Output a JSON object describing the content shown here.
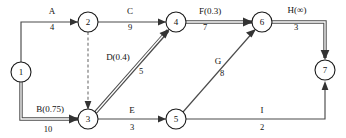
{
  "diagram": {
    "type": "activity-on-arrow-network",
    "nodes": [
      {
        "id": "1",
        "label": "1",
        "cx": 21,
        "cy": 72
      },
      {
        "id": "2",
        "label": "2",
        "cx": 88,
        "cy": 22
      },
      {
        "id": "3",
        "label": "3",
        "cx": 88,
        "cy": 119
      },
      {
        "id": "4",
        "label": "4",
        "cx": 176,
        "cy": 22
      },
      {
        "id": "5",
        "label": "5",
        "cx": 176,
        "cy": 119
      },
      {
        "id": "6",
        "label": "6",
        "cx": 262,
        "cy": 22
      },
      {
        "id": "7",
        "label": "7",
        "cx": 325,
        "cy": 70
      }
    ],
    "edges": [
      {
        "id": "A",
        "name": "A",
        "duration": "4",
        "from": "1",
        "to": "2",
        "style": "thin",
        "name_x": 52,
        "name_y": 14,
        "dur_x": 52,
        "dur_y": 30
      },
      {
        "id": "B",
        "name": "B(0.75)",
        "duration": "10",
        "from": "1",
        "to": "3",
        "style": "critical",
        "name_x": 50,
        "name_y": 112,
        "dur_x": 48,
        "dur_y": 132
      },
      {
        "id": "C",
        "name": "C",
        "duration": "9",
        "from": "2",
        "to": "4",
        "style": "thin",
        "name_x": 130,
        "name_y": 14,
        "dur_x": 130,
        "dur_y": 30
      },
      {
        "id": "dummy",
        "name": "",
        "duration": "",
        "from": "2",
        "to": "3",
        "style": "dashed",
        "name_x": 0,
        "name_y": 0,
        "dur_x": 0,
        "dur_y": 0
      },
      {
        "id": "D",
        "name": "D(0.4)",
        "duration": "5",
        "from": "3",
        "to": "4",
        "style": "critical",
        "name_x": 118,
        "name_y": 60,
        "dur_x": 141,
        "dur_y": 74
      },
      {
        "id": "E",
        "name": "E",
        "duration": "3",
        "from": "3",
        "to": "5",
        "style": "thin",
        "name_x": 132,
        "name_y": 113,
        "dur_x": 132,
        "dur_y": 130
      },
      {
        "id": "F",
        "name": "F(0.3)",
        "duration": "7",
        "from": "4",
        "to": "6",
        "style": "critical",
        "name_x": 210,
        "name_y": 14,
        "dur_x": 205,
        "dur_y": 30
      },
      {
        "id": "G",
        "name": "G",
        "duration": "8",
        "from": "5",
        "to": "6",
        "style": "thin",
        "name_x": 218,
        "name_y": 64,
        "dur_x": 222,
        "dur_y": 76
      },
      {
        "id": "H",
        "name": "H(∞)",
        "duration": "3",
        "from": "6",
        "to": "7",
        "style": "critical",
        "name_x": 297,
        "name_y": 13,
        "dur_x": 296,
        "dur_y": 30
      },
      {
        "id": "I",
        "name": "I",
        "duration": "2",
        "from": "5",
        "to": "7",
        "style": "thin",
        "name_x": 262,
        "name_y": 113,
        "dur_x": 262,
        "dur_y": 130
      }
    ],
    "colors": {
      "node_stroke": "#1a1a1a",
      "edge": "#4a4a4a",
      "dummy_edge": "#707070",
      "text": "#111111",
      "background": "#ffffff"
    }
  }
}
